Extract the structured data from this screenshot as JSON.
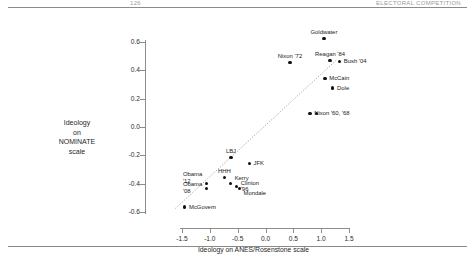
{
  "page": {
    "running_head_left": "126",
    "running_head_right": "ELECTORAL COMPETITION"
  },
  "chart_data": {
    "type": "scatter",
    "title": "",
    "xlabel": "Ideology on ANES/Rosenstone scale",
    "ylabel": "Ideology\non\nNOMINATE\nscale",
    "ylabel_lines": [
      "Ideology",
      "on",
      "NOMINATE",
      "scale"
    ],
    "xlim": [
      -1.75,
      1.75
    ],
    "ylim": [
      -0.65,
      0.68
    ],
    "xticks": [
      -1.5,
      -1.0,
      -0.5,
      0.0,
      0.5,
      1.0,
      1.5
    ],
    "xticklabels": [
      "-1.5",
      "-1.0",
      "-0.5",
      "0.0",
      "0.5",
      "1.0",
      "1.5"
    ],
    "yticks": [
      0.6,
      0.4,
      0.2,
      0.0,
      -0.2,
      -0.4,
      -0.6
    ],
    "yticklabels": [
      "0.6",
      "0.4",
      "0.2",
      "0.0",
      "-0.2",
      "-0.4",
      "-0.6"
    ],
    "grid": false,
    "legend": "none",
    "fit_line": {
      "style": "dotted",
      "color": "#9e9e9e",
      "x0": -1.62,
      "y0": -0.575,
      "x1": 1.28,
      "y1": 0.475
    },
    "points": [
      {
        "label": "Goldwater",
        "x": 1.05,
        "y": 0.625,
        "label_pos": "above"
      },
      {
        "label": "Nixon '72",
        "x": 0.44,
        "y": 0.455,
        "label_pos": "above"
      },
      {
        "label": "Reagan '84",
        "x": 1.16,
        "y": 0.47,
        "label_pos": "above"
      },
      {
        "label": "Bush '04",
        "x": 1.33,
        "y": 0.465,
        "label_pos": "right"
      },
      {
        "label": "McCain",
        "x": 1.07,
        "y": 0.345,
        "label_pos": "right"
      },
      {
        "label": "Dole",
        "x": 1.21,
        "y": 0.275,
        "label_pos": "right"
      },
      {
        "label": "Nixon '60, '68",
        "x": 0.8,
        "y": 0.098,
        "label_pos": "right"
      },
      {
        "label": "",
        "x": 0.92,
        "y": 0.098,
        "label_pos": "none"
      },
      {
        "label": "LBJ",
        "x": -0.62,
        "y": -0.215,
        "label_pos": "above"
      },
      {
        "label": "JFK",
        "x": -0.29,
        "y": -0.255,
        "label_pos": "right"
      },
      {
        "label": "HHH",
        "x": -0.74,
        "y": -0.355,
        "label_pos": "above"
      },
      {
        "label": "Kerry",
        "x": -0.63,
        "y": -0.398,
        "label_pos": "above-right"
      },
      {
        "label": "Clinton\n'96",
        "x": -0.52,
        "y": -0.42,
        "label_pos": "right"
      },
      {
        "label": "Mondale",
        "x": -0.47,
        "y": -0.432,
        "label_pos": "below-right"
      },
      {
        "label": "Obama\n'12",
        "x": -1.06,
        "y": -0.4,
        "label_pos": "above-left"
      },
      {
        "label": "Obama\n'08",
        "x": -1.06,
        "y": -0.432,
        "label_pos": "left"
      },
      {
        "label": "McGovern",
        "x": -1.45,
        "y": -0.565,
        "label_pos": "right"
      }
    ]
  }
}
